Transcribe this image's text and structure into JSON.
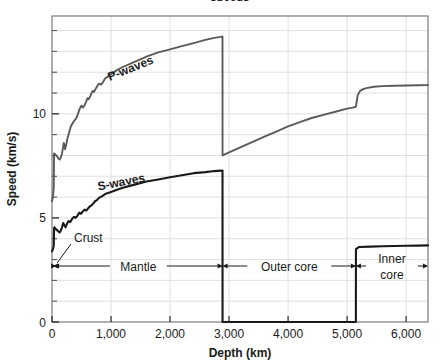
{
  "figure": {
    "title_fragment": "speeds",
    "background_color": "#ffffff",
    "plot_border_color": "#7a7a7a",
    "grid_color": "#d8d8d8",
    "p_wave_color": "#5a5a5a",
    "s_wave_color": "#1a1a1a",
    "annotation_color": "#1a1a1a"
  },
  "axes": {
    "x": {
      "label": "Depth (km)",
      "min": 0,
      "max": 6371,
      "ticks": [
        0,
        1000,
        2000,
        3000,
        4000,
        5000,
        6000
      ],
      "tick_labels": [
        "0",
        "1,000",
        "2,000",
        "3,000",
        "4,000",
        "5,000",
        "6,000"
      ]
    },
    "y": {
      "label": "Speed (km/s)",
      "min": 0,
      "max": 14.7,
      "ticks": [
        0,
        5,
        10
      ],
      "tick_labels": [
        "0",
        "5",
        "10"
      ],
      "minor_ticks": [
        1,
        2,
        3,
        4,
        6,
        7,
        8,
        9,
        11,
        12,
        13,
        14
      ],
      "grid": true
    }
  },
  "curve_labels": {
    "p_waves": "P-waves",
    "s_waves": "S-waves"
  },
  "layers": [
    {
      "name": "crust",
      "label": "Crust",
      "start_km": 0,
      "end_km": 35,
      "style": "leader"
    },
    {
      "name": "mantle",
      "label": "Mantle",
      "start_km": 35,
      "end_km": 2890,
      "style": "span"
    },
    {
      "name": "outer-core",
      "label": "Outer core",
      "start_km": 2890,
      "end_km": 5150,
      "style": "span"
    },
    {
      "name": "inner-core",
      "label": "Inner\ncore",
      "label_line1": "Inner",
      "label_line2": "core",
      "start_km": 5150,
      "end_km": 6371,
      "style": "span"
    }
  ],
  "chart_data": {
    "type": "line",
    "xlabel": "Depth (km)",
    "ylabel": "Speed (km/s)",
    "xlim": [
      0,
      6371
    ],
    "ylim": [
      0,
      14.7
    ],
    "grid": true,
    "legend": "inline-curve-labels",
    "annotations": [
      "Crust",
      "Mantle",
      "Outer core",
      "Inner core",
      "P-waves",
      "S-waves"
    ],
    "series": [
      {
        "name": "P-waves",
        "color": "#5a5a5a",
        "x": [
          0,
          15,
          25,
          30,
          35,
          40,
          55,
          70,
          90,
          110,
          130,
          150,
          170,
          185,
          200,
          210,
          220,
          240,
          260,
          290,
          320,
          360,
          400,
          420,
          440,
          470,
          500,
          520,
          550,
          580,
          600,
          620,
          650,
          670,
          690,
          710,
          740,
          770,
          800,
          830,
          860,
          880,
          900,
          950,
          1000,
          1100,
          1200,
          1400,
          1600,
          1800,
          2000,
          2200,
          2400,
          2600,
          2750,
          2860,
          2889,
          2890,
          3000,
          3200,
          3400,
          3600,
          3800,
          4000,
          4200,
          4400,
          4600,
          4800,
          5000,
          5100,
          5150,
          5180,
          5220,
          5280,
          5350,
          5450,
          5600,
          5800,
          6000,
          6200,
          6371
        ],
        "y": [
          5.8,
          6.0,
          6.3,
          6.5,
          8.1,
          8.1,
          8.05,
          8.0,
          7.95,
          7.85,
          7.8,
          7.9,
          8.1,
          8.35,
          8.6,
          8.5,
          8.3,
          8.5,
          8.8,
          9.1,
          9.4,
          9.6,
          9.75,
          9.85,
          10.0,
          10.25,
          10.4,
          10.3,
          10.4,
          10.6,
          10.75,
          10.7,
          10.85,
          11.0,
          11.1,
          11.05,
          11.2,
          11.35,
          11.45,
          11.4,
          11.5,
          11.6,
          11.7,
          11.8,
          11.9,
          12.1,
          12.25,
          12.5,
          12.75,
          12.95,
          13.1,
          13.25,
          13.4,
          13.55,
          13.65,
          13.7,
          13.72,
          8.0,
          8.15,
          8.4,
          8.65,
          8.9,
          9.15,
          9.4,
          9.6,
          9.8,
          9.95,
          10.1,
          10.25,
          10.3,
          10.35,
          10.9,
          11.1,
          11.2,
          11.25,
          11.3,
          11.33,
          11.35,
          11.36,
          11.37,
          11.38
        ],
        "notes": "Drops sharply at core-mantle boundary (2890 km) from 13.7 to 8.0; steps up at inner core boundary (5150 km)"
      },
      {
        "name": "S-waves",
        "color": "#1a1a1a",
        "x": [
          0,
          15,
          25,
          30,
          35,
          40,
          55,
          70,
          90,
          110,
          130,
          150,
          170,
          190,
          210,
          230,
          250,
          280,
          310,
          340,
          370,
          400,
          430,
          460,
          490,
          520,
          550,
          580,
          610,
          640,
          670,
          700,
          730,
          760,
          790,
          820,
          850,
          880,
          900,
          950,
          1000,
          1100,
          1200,
          1400,
          1600,
          1800,
          2000,
          2200,
          2400,
          2600,
          2750,
          2860,
          2889,
          2890,
          3000,
          4000,
          5000,
          5149,
          5150,
          5200,
          5400,
          5600,
          5800,
          6000,
          6200,
          6371
        ],
        "y": [
          3.4,
          3.5,
          3.6,
          3.7,
          4.5,
          4.55,
          4.5,
          4.45,
          4.4,
          4.35,
          4.3,
          4.4,
          4.55,
          4.75,
          4.65,
          4.55,
          4.7,
          4.85,
          4.8,
          4.95,
          5.05,
          5.0,
          5.1,
          5.25,
          5.2,
          5.3,
          5.4,
          5.35,
          5.45,
          5.55,
          5.6,
          5.7,
          5.8,
          5.85,
          5.95,
          6.0,
          6.05,
          6.1,
          6.15,
          6.2,
          6.25,
          6.35,
          6.45,
          6.6,
          6.75,
          6.85,
          6.95,
          7.05,
          7.15,
          7.2,
          7.25,
          7.27,
          7.28,
          0,
          0,
          0,
          0,
          0,
          3.5,
          3.6,
          3.62,
          3.64,
          3.65,
          3.66,
          3.67,
          3.68
        ],
        "notes": "Vanishes in liquid outer core (2890-5150 km), reappears at ~3.5 km/s in solid inner core"
      }
    ]
  }
}
